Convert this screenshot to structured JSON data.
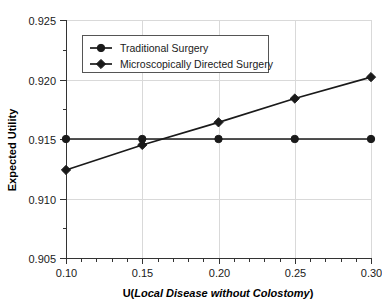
{
  "chart_data": {
    "type": "line",
    "title": "",
    "subtitle": "",
    "xlabel_prefix": "U(",
    "xlabel_italic": "Local Disease without Colostomy",
    "xlabel_suffix": ")",
    "xlabel_full": "U(Local Disease without Colostomy)",
    "ylabel": "Expected Utility",
    "xlim": [
      0.1,
      0.3
    ],
    "ylim": [
      0.905,
      0.925
    ],
    "grid": true,
    "legend_position": "top-center",
    "x": [
      0.1,
      0.15,
      0.2,
      0.25,
      0.3
    ],
    "xtick_labels": [
      "0.10",
      "0.15",
      "0.20",
      "0.25",
      "0.30"
    ],
    "ytick_labels": [
      "0.905",
      "0.910",
      "0.915",
      "0.920",
      "0.925"
    ],
    "ytick_values": [
      0.905,
      0.91,
      0.915,
      0.92,
      0.925
    ],
    "x_minor_ticks": [
      0.11,
      0.12,
      0.13,
      0.14,
      0.16,
      0.17,
      0.18,
      0.19,
      0.21,
      0.22,
      0.23,
      0.24,
      0.26,
      0.27,
      0.28,
      0.29
    ],
    "y_minor_ticks": [
      0.9075,
      0.9125,
      0.9175,
      0.9225
    ],
    "series": [
      {
        "name": "Traditional Surgery",
        "marker": "circle",
        "color": "#1a1a1a",
        "values": [
          0.915,
          0.915,
          0.915,
          0.915,
          0.915
        ]
      },
      {
        "name": "Microscopically Directed Surgery",
        "marker": "diamond",
        "color": "#1a1a1a",
        "values": [
          0.9124,
          0.9145,
          0.9164,
          0.9184,
          0.9202
        ]
      }
    ]
  },
  "legend": {
    "entries": [
      {
        "label": "Traditional Surgery",
        "marker": "circle"
      },
      {
        "label": "Microscopically Directed Surgery",
        "marker": "diamond"
      }
    ]
  },
  "colors": {
    "series_line": "#1a1a1a",
    "gridline": "#d9d9d9",
    "axis": "#333333",
    "background": "#ffffff",
    "text": "#1a1a1a"
  }
}
